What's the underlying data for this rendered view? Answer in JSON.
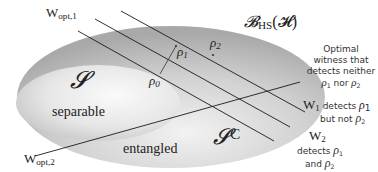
{
  "diagram": {
    "space_label": "𝓑",
    "space_sub": "HS",
    "space_arg": "(𝓗)",
    "separable_symbol": "𝓢",
    "separable_label": "separable",
    "entangled_symbol": "𝓢",
    "entangled_sup": "C",
    "entangled_label": "entangled",
    "states": {
      "rho0": "ρ",
      "rho0_sub": "0",
      "rho1": "ρ",
      "rho1_sub": "1",
      "rho2": "ρ",
      "rho2_sub": "2"
    },
    "witnesses": {
      "wopt1": "W",
      "wopt1_sub": "opt,1",
      "wopt2": "W",
      "wopt2_sub": "opt,2",
      "w1": "W",
      "w1_sub": "1",
      "w2": "W",
      "w2_sub": "2"
    },
    "annotations": {
      "optimal_line1": "Optimal",
      "optimal_line2": "witness that",
      "optimal_line3": "detects neither",
      "optimal_line4_a": "ρ",
      "optimal_line4_a_sub": "1",
      "optimal_line4_mid": " nor ",
      "optimal_line4_b": "ρ",
      "optimal_line4_b_sub": "2",
      "w1_text_a": " detects ",
      "w1_rho": "ρ",
      "w1_rho_sub": "1",
      "w1_text_b": "but not ",
      "w1_rho2": "ρ",
      "w1_rho2_sub": "2",
      "w2_text_a": "detects ",
      "w2_rho": "ρ",
      "w2_rho_sub": "1",
      "w2_text_b": "and ",
      "w2_rho2": "ρ",
      "w2_rho2_sub": "2"
    },
    "colors": {
      "outer_fill": "#b5b5b5",
      "inner_fill": "#e4e4e4",
      "line": "#1a1a1a"
    }
  }
}
